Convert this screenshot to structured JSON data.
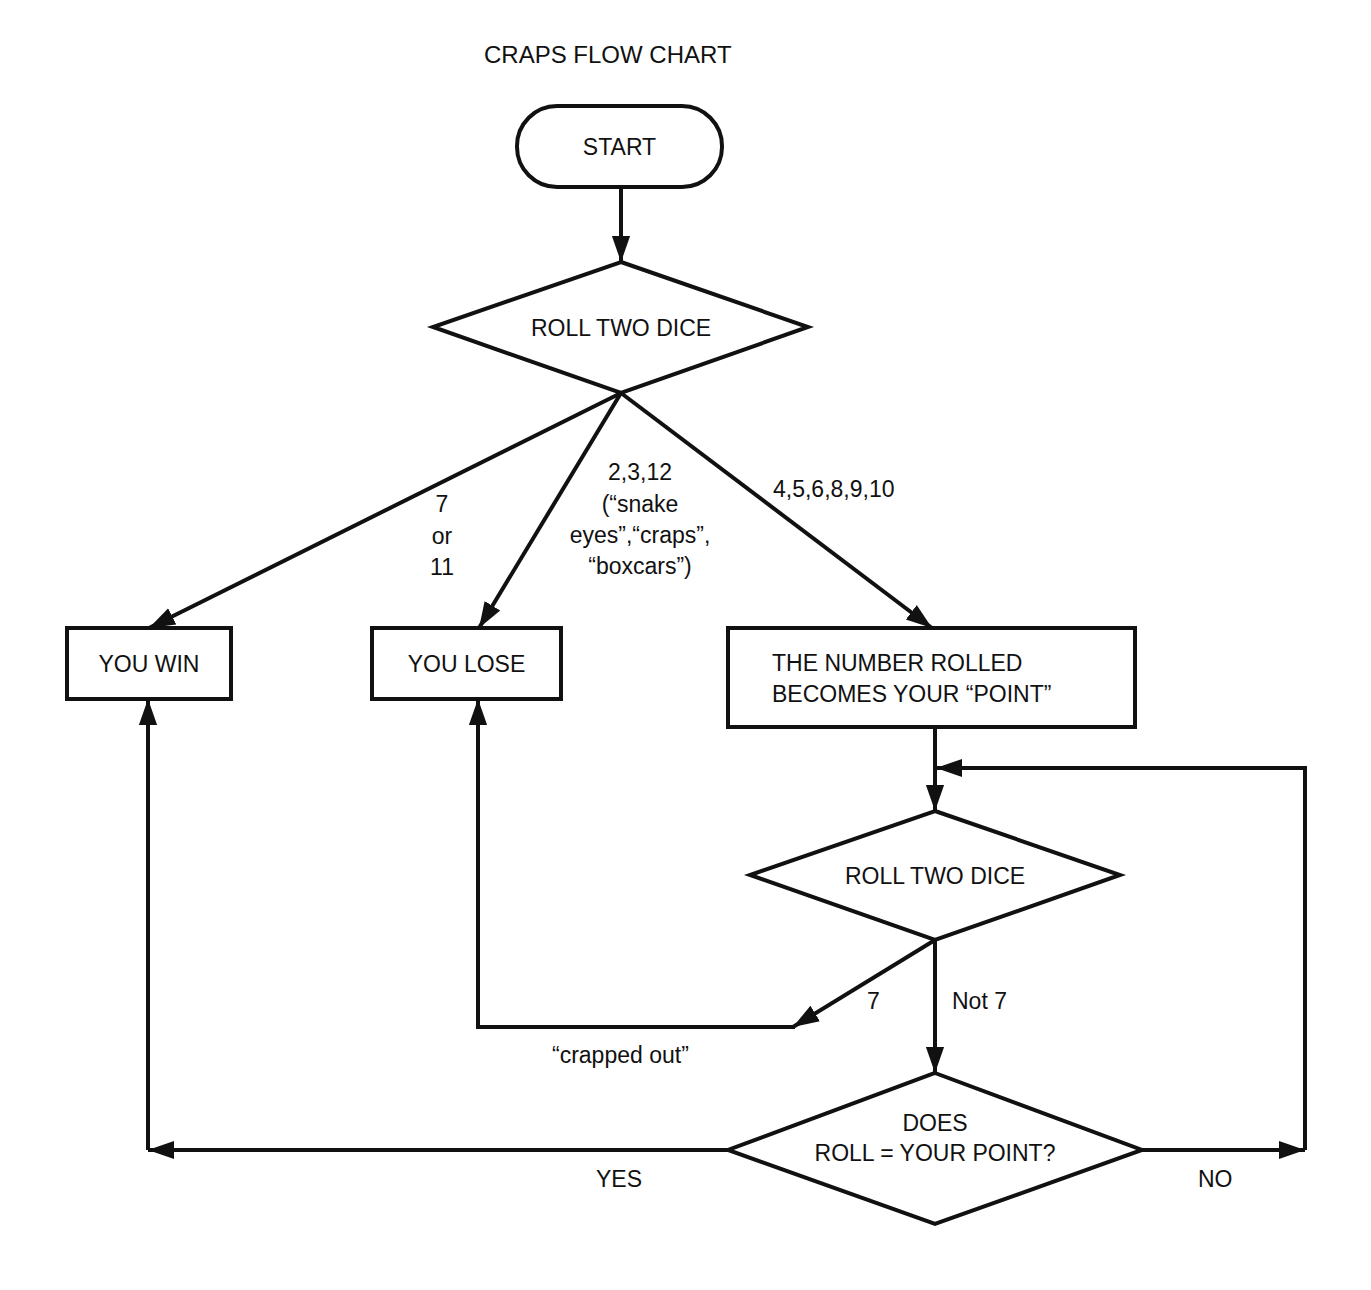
{
  "title": "CRAPS FLOW CHART",
  "nodes": {
    "start": "START",
    "roll1": "ROLL TWO DICE",
    "win": "YOU WIN",
    "lose": "YOU LOSE",
    "point_line1": "THE NUMBER ROLLED",
    "point_line2": "BECOMES YOUR “POINT”",
    "roll2": "ROLL TWO DICE",
    "check_line1": "DOES",
    "check_line2": "ROLL = YOUR POINT?"
  },
  "edges": {
    "win_line1": "7",
    "win_line2": "or",
    "win_line3": "11",
    "lose_line1": "2,3,12",
    "lose_line2": "(“snake",
    "lose_line3": "eyes”,“craps”,",
    "lose_line4": "“boxcars”)",
    "point": "4,5,6,8,9,10",
    "seven": "7",
    "not_seven": "Not 7",
    "crapped_out": "“crapped out”",
    "yes": "YES",
    "no": "NO"
  }
}
